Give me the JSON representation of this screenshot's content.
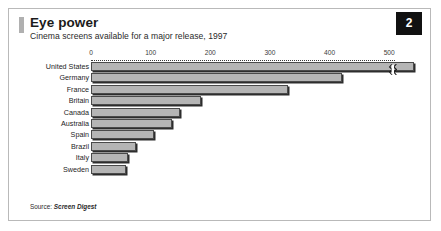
{
  "figure": {
    "badge_number": "2",
    "title": "Eye power",
    "subtitle": "Cinema screens available for a major release, 1997",
    "source_lead": "Source: ",
    "source_name": "Screen Digest",
    "colors": {
      "bar_fill": "#b5b5b5",
      "bar_outline": "#4a4a4a",
      "bar_shadow": "#2d2d2d",
      "badge_background": "#111111",
      "badge_text": "#ffffff",
      "frame_border": "#b9b9b9",
      "title_accent": "#b0b0b0"
    }
  },
  "chart_data": {
    "type": "bar",
    "orientation": "horizontal",
    "title": "Eye power",
    "subtitle": "Cinema screens available for a major release, 1997",
    "xlabel": "",
    "ylabel": "",
    "xlim": [
      0,
      560
    ],
    "grid": false,
    "legend": null,
    "axis_break": {
      "present": true,
      "series_index": 0,
      "note": "United States bar is broken; its true value exceeds the plotted axis range"
    },
    "ticks": [
      0,
      100,
      200,
      300,
      400,
      500
    ],
    "tick_labels": [
      "0",
      "100",
      "200",
      "300",
      "400",
      "500"
    ],
    "categories": [
      "United States",
      "Germany",
      "France",
      "Britain",
      "Canada",
      "Australia",
      "Spain",
      "Brazil",
      "Italy",
      "Sweden"
    ],
    "values": [
      700,
      420,
      330,
      185,
      150,
      135,
      105,
      75,
      62,
      58
    ]
  }
}
